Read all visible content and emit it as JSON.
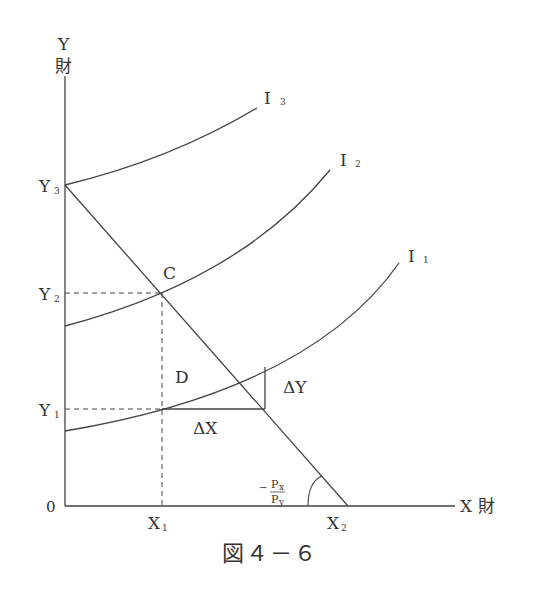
{
  "diagram": {
    "caption": "図４－６",
    "axes": {
      "y_label": "Y",
      "y_label_kanji": "財",
      "x_label": "X 財",
      "origin": "0"
    },
    "y_ticks": [
      {
        "base": "Y",
        "sub": "3"
      },
      {
        "base": "Y",
        "sub": "2"
      },
      {
        "base": "Y",
        "sub": "1"
      }
    ],
    "x_ticks": [
      {
        "base": "X",
        "sub": "1"
      },
      {
        "base": "X",
        "sub": "2"
      }
    ],
    "curves": [
      {
        "base": "I",
        "sub": "3"
      },
      {
        "base": "I",
        "sub": "2"
      },
      {
        "base": "I",
        "sub": "1"
      }
    ],
    "points": {
      "c": "C",
      "d": "D"
    },
    "deltas": {
      "dx": "ΔX",
      "dy": "ΔY"
    },
    "slope": {
      "minus": "−",
      "num_base": "P",
      "num_sub": "x",
      "den_base": "P",
      "den_sub": "y"
    }
  },
  "colors": {
    "line": "#444444",
    "text": "#333333",
    "background": "#ffffff"
  }
}
